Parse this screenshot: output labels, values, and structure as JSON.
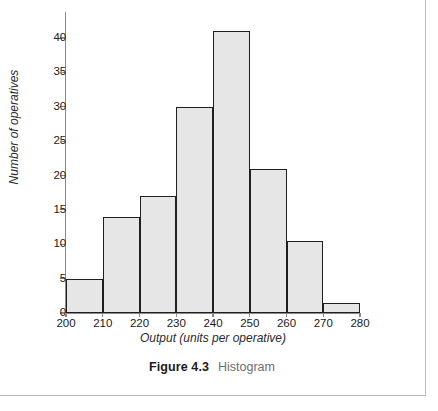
{
  "figure": {
    "caption_number": "Figure 4.3",
    "caption_text": "Histogram"
  },
  "chart_data": {
    "type": "bar",
    "title": "",
    "subtitle": "",
    "xlabel": "Output (units per operative)",
    "ylabel": "Number of operatives",
    "xlim": [
      200,
      280
    ],
    "ylim": [
      0,
      43.5
    ],
    "xticks": [
      200,
      210,
      220,
      230,
      240,
      250,
      260,
      270,
      280
    ],
    "xtick_labels": [
      "200",
      "210",
      "220",
      "230",
      "240",
      "250",
      "260",
      "270",
      "280"
    ],
    "yticks": [
      0,
      5,
      10,
      15,
      20,
      25,
      30,
      35,
      40
    ],
    "ytick_labels": [
      "0",
      "5",
      "10",
      "15",
      "20",
      "25",
      "30",
      "35",
      "40"
    ],
    "grid": false,
    "legend": false,
    "bin_width": 10,
    "categories": [
      "200-210",
      "210-220",
      "220-230",
      "230-240",
      "240-250",
      "250-260",
      "260-270",
      "270-280"
    ],
    "bin_edges": [
      200,
      210,
      220,
      230,
      240,
      250,
      260,
      270,
      280
    ],
    "values": [
      5,
      14,
      17,
      30,
      41,
      21,
      10.5,
      1.5
    ],
    "bar_fill": "#e6e6e6",
    "bar_edge": "#1f1f1f",
    "axis_color": "#8a8a8a"
  },
  "frame": {
    "rule_color": "#b9b9b9"
  }
}
